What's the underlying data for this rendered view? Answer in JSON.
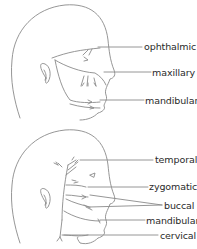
{
  "diagrams": [
    {
      "subject": "trigeminal nerve branches",
      "labels": [
        "ophthalmic",
        "maxillary",
        "mandibular"
      ]
    },
    {
      "subject": "facial nerve branches",
      "labels": [
        "temporal",
        "zygomatic",
        "buccal",
        "mandibular",
        "cervical"
      ]
    }
  ],
  "colors": {
    "line": "#8a8a8a",
    "text": "#2a2a2a",
    "background": "#ffffff"
  }
}
